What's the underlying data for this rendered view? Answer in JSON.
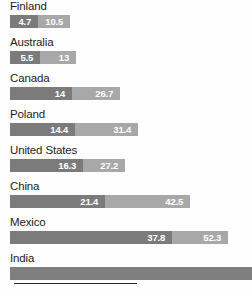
{
  "chart_data": {
    "type": "bar",
    "orientation": "horizontal",
    "stacked": true,
    "title": "",
    "subtitle": "",
    "xlabel": "",
    "ylabel": "",
    "grid": false,
    "legend": null,
    "xlim": [
      0,
      60
    ],
    "categories": [
      "Finland",
      "Australia",
      "Canada",
      "Poland",
      "United States",
      "China",
      "Mexico",
      "India"
    ],
    "series": [
      {
        "name": "segment-1",
        "color": "#7b7b7b",
        "values": [
          4.7,
          5.5,
          14,
          14.4,
          16.3,
          21.4,
          37.8,
          null
        ]
      },
      {
        "name": "segment-2",
        "color": "#a8a8a8",
        "values": [
          10.5,
          13,
          26.7,
          31.4,
          27.2,
          42.5,
          52.3,
          null
        ]
      }
    ],
    "rows": [
      {
        "label": "Finland",
        "segments": [
          {
            "value": "4.7",
            "display": "4.7",
            "width_px": 28,
            "tone": "dark",
            "show_value": true
          },
          {
            "value": "10.5",
            "display": "10.5",
            "width_px": 32,
            "tone": "light",
            "show_value": true
          }
        ]
      },
      {
        "label": "Australia",
        "segments": [
          {
            "value": "5.5",
            "display": "5.5",
            "width_px": 30,
            "tone": "dark",
            "show_value": true
          },
          {
            "value": "13",
            "display": "13",
            "width_px": 36,
            "tone": "light",
            "show_value": true
          }
        ]
      },
      {
        "label": "Canada",
        "segments": [
          {
            "value": "14",
            "display": "14",
            "width_px": 62,
            "tone": "dark",
            "show_value": true
          },
          {
            "value": "26.7",
            "display": "26.7",
            "width_px": 48,
            "tone": "light",
            "show_value": true
          }
        ]
      },
      {
        "label": "Poland",
        "segments": [
          {
            "value": "14.4",
            "display": "14.4",
            "width_px": 65,
            "tone": "dark",
            "show_value": true
          },
          {
            "value": "31.4",
            "display": "31.4",
            "width_px": 63,
            "tone": "light",
            "show_value": true
          }
        ]
      },
      {
        "label": "United States",
        "segments": [
          {
            "value": "16.3",
            "display": "16.3",
            "width_px": 73,
            "tone": "dark",
            "show_value": true
          },
          {
            "value": "27.2",
            "display": "27.2",
            "width_px": 42,
            "tone": "light",
            "show_value": true
          }
        ]
      },
      {
        "label": "China",
        "segments": [
          {
            "value": "21.4",
            "display": "21.4",
            "width_px": 95,
            "tone": "dark",
            "show_value": true
          },
          {
            "value": "42.5",
            "display": "42.5",
            "width_px": 85,
            "tone": "light",
            "show_value": true
          }
        ]
      },
      {
        "label": "Mexico",
        "segments": [
          {
            "value": "37.8",
            "display": "37.8",
            "width_px": 162,
            "tone": "dark",
            "show_value": true
          },
          {
            "value": "52.3",
            "display": "52.3",
            "width_px": 56,
            "tone": "light",
            "show_value": true
          }
        ]
      },
      {
        "label": "India",
        "segments": [
          {
            "value": "",
            "display": "",
            "width_px": 242,
            "tone": "solid",
            "show_value": false
          }
        ]
      }
    ],
    "axis_rule": {
      "width_px": 123
    },
    "colors": {
      "segment_dark": "#7b7b7b",
      "segment_light": "#a8a8a8",
      "segment_solid": "#7f7f7f",
      "value_text": "#ffffff",
      "label_text": "#1d1d1d",
      "axis_rule": "#2a2a2a",
      "background": "#fefefe"
    }
  }
}
